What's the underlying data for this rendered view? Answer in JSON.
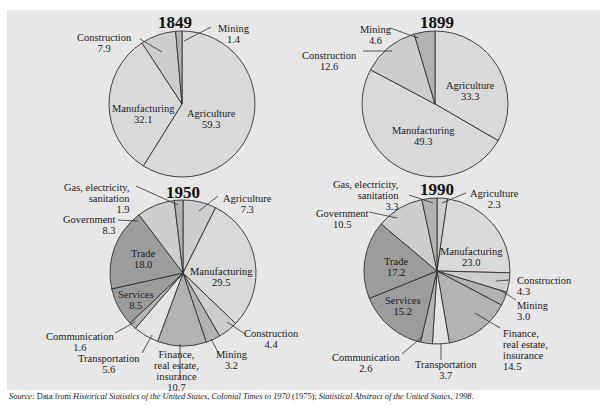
{
  "chart_data": [
    {
      "type": "pie",
      "title": "1849",
      "start_angle_deg": 0,
      "direction": "clockwise",
      "slices": [
        {
          "label": "Agriculture",
          "value": 59.3,
          "shade": "light"
        },
        {
          "label": "Manufacturing",
          "value": 32.1,
          "shade": "light"
        },
        {
          "label": "Construction",
          "value": 7.9,
          "shade": "light2"
        },
        {
          "label": "Mining",
          "value": 1.4,
          "shade": "mid"
        }
      ]
    },
    {
      "type": "pie",
      "title": "1899",
      "start_angle_deg": 0,
      "direction": "clockwise",
      "slices": [
        {
          "label": "Agriculture",
          "value": 33.3,
          "shade": "light"
        },
        {
          "label": "Manufacturing",
          "value": 49.3,
          "shade": "light"
        },
        {
          "label": "Construction",
          "value": 12.6,
          "shade": "light2"
        },
        {
          "label": "Mining",
          "value": 4.6,
          "shade": "mid"
        }
      ]
    },
    {
      "type": "pie",
      "title": "1950",
      "start_angle_deg": 0,
      "direction": "clockwise",
      "slices": [
        {
          "label": "Agriculture",
          "value": 7.3,
          "shade": "light2"
        },
        {
          "label": "Manufacturing",
          "value": 29.5,
          "shade": "light"
        },
        {
          "label": "Construction",
          "value": 4.4,
          "shade": "light2"
        },
        {
          "label": "Mining",
          "value": 3.2,
          "shade": "mid"
        },
        {
          "label": "Finance, real estate, insurance",
          "value": 10.7,
          "shade": "mid"
        },
        {
          "label": "Transportation",
          "value": 5.6,
          "shade": "pale"
        },
        {
          "label": "Communication",
          "value": 1.6,
          "shade": "mid"
        },
        {
          "label": "Services",
          "value": 8.5,
          "shade": "dark"
        },
        {
          "label": "Trade",
          "value": 18.0,
          "shade": "dark"
        },
        {
          "label": "Government",
          "value": 8.3,
          "shade": "light2"
        },
        {
          "label": "Gas, electricity, sanitation",
          "value": 1.9,
          "shade": "mid"
        }
      ]
    },
    {
      "type": "pie",
      "title": "1990",
      "start_angle_deg": 0,
      "direction": "clockwise",
      "slices": [
        {
          "label": "Agriculture",
          "value": 2.3,
          "shade": "light2"
        },
        {
          "label": "Manufacturing",
          "value": 23.0,
          "shade": "light"
        },
        {
          "label": "Construction",
          "value": 4.3,
          "shade": "light2"
        },
        {
          "label": "Mining",
          "value": 3.0,
          "shade": "mid"
        },
        {
          "label": "Finance, real estate, insurance",
          "value": 14.5,
          "shade": "mid"
        },
        {
          "label": "Transportation",
          "value": 3.7,
          "shade": "pale"
        },
        {
          "label": "Communication",
          "value": 2.6,
          "shade": "mid"
        },
        {
          "label": "Services",
          "value": 15.2,
          "shade": "dark"
        },
        {
          "label": "Trade",
          "value": 17.2,
          "shade": "dark"
        },
        {
          "label": "Government",
          "value": 10.5,
          "shade": "light2"
        },
        {
          "label": "Gas, electricity, sanitation",
          "value": 3.3,
          "shade": "mid"
        }
      ]
    }
  ],
  "colors": {
    "panel": "#e7e7e7",
    "light": "#d9d9d9",
    "light2": "#cdcdcd",
    "pale": "#e4e4e4",
    "mid": "#b2b2b2",
    "dark": "#9c9c9c",
    "stroke": "#333333"
  },
  "labels": {
    "y1849": {
      "year": "1849",
      "agriculture": [
        "Agriculture",
        "59.3"
      ],
      "manufacturing": [
        "Manufacturing",
        "32.1"
      ],
      "construction": [
        "Construction",
        "7.9"
      ],
      "mining": [
        "Mining",
        "1.4"
      ]
    },
    "y1899": {
      "year": "1899",
      "agriculture": [
        "Agriculture",
        "33.3"
      ],
      "manufacturing": [
        "Manufacturing",
        "49.3"
      ],
      "construction": [
        "Construction",
        "12.6"
      ],
      "mining": [
        "Mining",
        "4.6"
      ]
    },
    "y1950": {
      "year": "1950",
      "gas": [
        "Gas, electricity,",
        "sanitation",
        "1.9"
      ],
      "agriculture": [
        "Agriculture",
        "7.3"
      ],
      "government": [
        "Government",
        "8.3"
      ],
      "trade": [
        "Trade",
        "18.0"
      ],
      "manufacturing": [
        "Manufacturing",
        "29.5"
      ],
      "services": [
        "Services",
        "8.5"
      ],
      "communication": [
        "Communication",
        "1.6"
      ],
      "transportation": [
        "Transportation",
        "5.6"
      ],
      "finance": [
        "Finance,",
        "real estate,",
        "insurance",
        "10.7"
      ],
      "mining": [
        "Mining",
        "3.2"
      ],
      "construction": [
        "Construction",
        "4.4"
      ]
    },
    "y1990": {
      "year": "1990",
      "gas": [
        "Gas, electricity,",
        "sanitation",
        "3.3"
      ],
      "agriculture": [
        "Agriculture",
        "2.3"
      ],
      "government": [
        "Government",
        "10.5"
      ],
      "manufacturing": [
        "Manufacturing",
        "23.0"
      ],
      "trade": [
        "Trade",
        "17.2"
      ],
      "construction": [
        "Construction",
        "4.3"
      ],
      "mining": [
        "Mining",
        "3.0"
      ],
      "services": [
        "Services",
        "15.2"
      ],
      "finance": [
        "Finance,",
        "real estate,",
        "insurance",
        "14.5"
      ],
      "communication": [
        "Communication",
        "2.6"
      ],
      "transportation": [
        "Transportation",
        "3.7"
      ]
    }
  },
  "source": {
    "prefix": "Source:",
    "text1": " Data from ",
    "title1": "Historical Statistics of the United States, Colonial Times to 1970",
    "text2": " (1975); ",
    "title2": "Statistical Abstract of the United States, 1998."
  }
}
